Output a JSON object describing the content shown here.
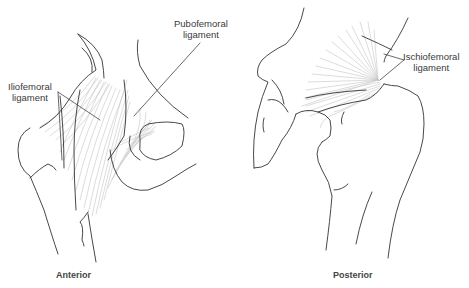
{
  "figure": {
    "views": [
      {
        "id": "anterior",
        "caption": "Anterior",
        "labels": [
          {
            "id": "iliofemoral",
            "line1": "Iliofemoral",
            "line2": "ligament"
          },
          {
            "id": "pubofemoral",
            "line1": "Pubofemoral",
            "line2": "ligament"
          }
        ]
      },
      {
        "id": "posterior",
        "caption": "Posterior",
        "labels": [
          {
            "id": "ischiofemoral",
            "line1": "Ischiofemoral",
            "line2": "ligament"
          }
        ]
      }
    ],
    "colors": {
      "outline": "#333333",
      "fiber": "#bdbdbd",
      "leader": "#444444",
      "text": "#3a3a3a"
    }
  }
}
